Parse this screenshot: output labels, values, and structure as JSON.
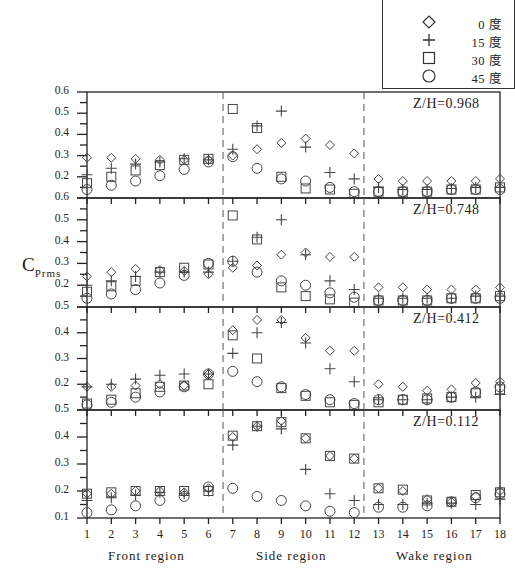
{
  "chart_data": {
    "type": "scatter",
    "title": "",
    "xlabel": "Measurement point (Front region / Side region / Wake region)",
    "ylabel": "C_Prms",
    "x": [
      1,
      2,
      3,
      4,
      5,
      6,
      7,
      8,
      9,
      10,
      11,
      12,
      13,
      14,
      15,
      16,
      17,
      18
    ],
    "x_tick_labels": [
      "1",
      "2",
      "3",
      "4",
      "5",
      "6",
      "7",
      "8",
      "9",
      "10",
      "11",
      "12",
      "13",
      "14",
      "15",
      "16",
      "17",
      "18"
    ],
    "regions": [
      {
        "name": "Front region",
        "points": [
          1,
          6
        ]
      },
      {
        "name": "Side region",
        "points": [
          7,
          12
        ]
      },
      {
        "name": "Wake region",
        "points": [
          13,
          18
        ]
      }
    ],
    "region_dividers_x": [
      6.6,
      12.4
    ],
    "legend": [
      {
        "marker": "diamond",
        "label": "0 度"
      },
      {
        "marker": "plus",
        "label": "15 度"
      },
      {
        "marker": "square",
        "label": "30 度"
      },
      {
        "marker": "circle",
        "label": "45 度"
      }
    ],
    "panels": [
      {
        "label": "Z/H=0.968",
        "ylim": [
          0.1,
          0.6
        ],
        "yticks": [
          0.2,
          0.3,
          0.4,
          0.5,
          0.6
        ],
        "series": [
          {
            "name": "0 度",
            "values": [
              0.29,
              0.29,
              0.285,
              0.28,
              0.28,
              0.28,
              0.3,
              0.33,
              0.36,
              0.38,
              0.35,
              0.31,
              0.19,
              0.18,
              0.18,
              0.18,
              0.18,
              0.19
            ]
          },
          {
            "name": "15 度",
            "values": [
              0.21,
              0.24,
              0.26,
              0.27,
              0.285,
              0.28,
              0.33,
              0.44,
              0.51,
              0.34,
              0.22,
              0.19,
              0.15,
              0.14,
              0.14,
              0.145,
              0.15,
              0.15
            ]
          },
          {
            "name": "30 度",
            "values": [
              0.17,
              0.2,
              0.23,
              0.255,
              0.28,
              0.285,
              0.52,
              0.43,
              0.2,
              0.145,
              0.14,
              0.12,
              0.13,
              0.13,
              0.13,
              0.14,
              0.14,
              0.15
            ]
          },
          {
            "name": "45 度",
            "values": [
              0.14,
              0.16,
              0.18,
              0.205,
              0.235,
              0.27,
              0.295,
              0.24,
              0.19,
              0.18,
              0.15,
              0.13,
              0.13,
              0.13,
              0.13,
              0.14,
              0.14,
              0.14
            ]
          }
        ]
      },
      {
        "label": "Z/H=0.748",
        "ylim": [
          0.1,
          0.6
        ],
        "yticks": [
          0.2,
          0.3,
          0.4,
          0.5,
          0.6
        ],
        "series": [
          {
            "name": "0 度",
            "values": [
              0.24,
              0.26,
              0.275,
              0.27,
              0.265,
              0.25,
              0.28,
              0.29,
              0.34,
              0.35,
              0.33,
              0.33,
              0.19,
              0.19,
              0.18,
              0.18,
              0.18,
              0.19
            ]
          },
          {
            "name": "15 度",
            "values": [
              0.2,
              0.22,
              0.24,
              0.26,
              0.26,
              0.26,
              0.31,
              0.42,
              0.5,
              0.34,
              0.22,
              0.18,
              0.14,
              0.14,
              0.14,
              0.14,
              0.15,
              0.15
            ]
          },
          {
            "name": "30 度",
            "values": [
              0.17,
              0.195,
              0.22,
              0.26,
              0.28,
              0.295,
              0.52,
              0.41,
              0.19,
              0.15,
              0.135,
              0.12,
              0.13,
              0.13,
              0.13,
              0.14,
              0.14,
              0.15
            ]
          },
          {
            "name": "45 度",
            "values": [
              0.14,
              0.16,
              0.18,
              0.21,
              0.245,
              0.3,
              0.31,
              0.26,
              0.22,
              0.2,
              0.165,
              0.145,
              0.13,
              0.13,
              0.13,
              0.14,
              0.14,
              0.14
            ]
          }
        ]
      },
      {
        "label": "Z/H=0.412",
        "ylim": [
          0.1,
          0.5
        ],
        "yticks": [
          0.2,
          0.3,
          0.4,
          0.5
        ],
        "series": [
          {
            "name": "0 度",
            "values": [
              0.19,
              0.19,
              0.195,
              0.2,
              0.195,
              0.24,
              0.41,
              0.45,
              0.45,
              0.38,
              0.33,
              0.33,
              0.2,
              0.19,
              0.175,
              0.18,
              0.205,
              0.21
            ]
          },
          {
            "name": "15 度",
            "values": [
              0.19,
              0.2,
              0.22,
              0.235,
              0.24,
              0.24,
              0.32,
              0.4,
              0.44,
              0.36,
              0.26,
              0.21,
              0.14,
              0.14,
              0.14,
              0.15,
              0.15,
              0.16
            ]
          },
          {
            "name": "30 度",
            "values": [
              0.125,
              0.14,
              0.165,
              0.19,
              0.195,
              0.2,
              0.39,
              0.3,
              0.185,
              0.155,
              0.13,
              0.12,
              0.13,
              0.14,
              0.145,
              0.15,
              0.165,
              0.18
            ]
          },
          {
            "name": "45 度",
            "values": [
              0.12,
              0.13,
              0.15,
              0.17,
              0.19,
              0.24,
              0.25,
              0.21,
              0.19,
              0.16,
              0.14,
              0.125,
              0.14,
              0.14,
              0.14,
              0.15,
              0.17,
              0.19
            ]
          }
        ]
      },
      {
        "label": "Z/H=0.112",
        "ylim": [
          0.1,
          0.5
        ],
        "yticks": [
          0.1,
          0.2,
          0.3,
          0.4,
          0.5
        ],
        "series": [
          {
            "name": "0 度",
            "values": [
              0.19,
              0.19,
              0.2,
              0.2,
              0.195,
              0.21,
              0.4,
              0.44,
              0.46,
              0.395,
              0.33,
              0.32,
              0.21,
              0.2,
              0.17,
              0.16,
              0.18,
              0.2
            ]
          },
          {
            "name": "15 度",
            "values": [
              0.165,
              0.175,
              0.185,
              0.195,
              0.19,
              0.2,
              0.37,
              0.44,
              0.43,
              0.28,
              0.19,
              0.165,
              0.15,
              0.15,
              0.155,
              0.155,
              0.15,
              0.17
            ]
          },
          {
            "name": "30 度",
            "values": [
              0.19,
              0.195,
              0.2,
              0.2,
              0.2,
              0.2,
              0.405,
              0.44,
              0.455,
              0.395,
              0.33,
              0.32,
              0.21,
              0.205,
              0.165,
              0.16,
              0.185,
              0.195
            ]
          },
          {
            "name": "45 度",
            "values": [
              0.12,
              0.13,
              0.145,
              0.165,
              0.18,
              0.215,
              0.21,
              0.18,
              0.165,
              0.145,
              0.125,
              0.12,
              0.14,
              0.14,
              0.145,
              0.16,
              0.175,
              0.19
            ]
          }
        ]
      }
    ]
  },
  "legend": {
    "items": [
      {
        "marker": "diamond-icon",
        "label": "0 度"
      },
      {
        "marker": "plus-icon",
        "label": "15 度"
      },
      {
        "marker": "square-icon",
        "label": "30 度"
      },
      {
        "marker": "circle-icon",
        "label": "45 度"
      }
    ]
  },
  "axis": {
    "y_label_main": "C",
    "y_label_sub": "Prms"
  },
  "regions": {
    "front": "Front region",
    "side": "Side region",
    "wake": "Wake region"
  },
  "colors": {
    "marker": "#444444",
    "axis": "#222222",
    "divider": "#555555"
  }
}
